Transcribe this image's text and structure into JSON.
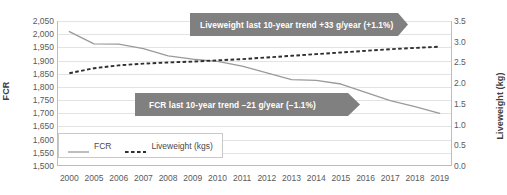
{
  "chart_data": {
    "type": "line",
    "title": "",
    "xlabel": "",
    "ylabel": "FCR",
    "y2label": "Liveweight (kg)",
    "grid": true,
    "legend_position": "inside-bottom-left",
    "categories": [
      "2000",
      "2005",
      "2006",
      "2007",
      "2008",
      "2009",
      "2010",
      "2011",
      "2012",
      "2013",
      "2014",
      "2015",
      "2016",
      "2017",
      "2018",
      "2019"
    ],
    "ylim": [
      1500,
      2050
    ],
    "ytick_labels": [
      "2,050",
      "2,000",
      "1,950",
      "1,900",
      "1,850",
      "1,800",
      "1,750",
      "1,700",
      "1,650",
      "1,600",
      "1,550",
      "1,500"
    ],
    "ytick_values": [
      2050,
      2000,
      1950,
      1900,
      1850,
      1800,
      1750,
      1700,
      1650,
      1600,
      1550,
      1500
    ],
    "y2lim": [
      0.0,
      3.5
    ],
    "y2tick_labels": [
      "3.5",
      "3.0",
      "2.5",
      "2.0",
      "1.5",
      "1.0",
      "0.5",
      "0.0"
    ],
    "y2tick_values": [
      3.5,
      3.0,
      2.5,
      2.0,
      1.5,
      1.0,
      0.5,
      0.0
    ],
    "series": [
      {
        "name": "FCR",
        "axis": "left",
        "style": "solid",
        "color": "#9a9a9a",
        "values": [
          2010,
          1963,
          1962,
          1945,
          1918,
          1905,
          1897,
          1879,
          1853,
          1828,
          1825,
          1811,
          1779,
          1748,
          1725,
          1700
        ]
      },
      {
        "name": "Liveweight (kgs)",
        "axis": "right",
        "style": "dashed",
        "color": "#2f2f2f",
        "values": [
          2.24,
          2.36,
          2.43,
          2.47,
          2.5,
          2.52,
          2.55,
          2.58,
          2.62,
          2.66,
          2.7,
          2.74,
          2.78,
          2.82,
          2.85,
          2.88
        ]
      }
    ],
    "annotations": [
      {
        "id": "liveweight-trend",
        "text": "Liveweight last 10-year trend +33 g/year (+1.1%)",
        "background": "#808080",
        "text_color": "#ffffff"
      },
      {
        "id": "fcr-trend",
        "text": "FCR last 10-year trend −21 g/year (−1.1%)",
        "background": "#808080",
        "text_color": "#ffffff"
      }
    ],
    "legend": [
      {
        "label": "FCR",
        "style": "solid",
        "color": "#9a9a9a"
      },
      {
        "label": "Liveweight (kgs)",
        "style": "dashed",
        "color": "#2f2f2f"
      }
    ]
  }
}
